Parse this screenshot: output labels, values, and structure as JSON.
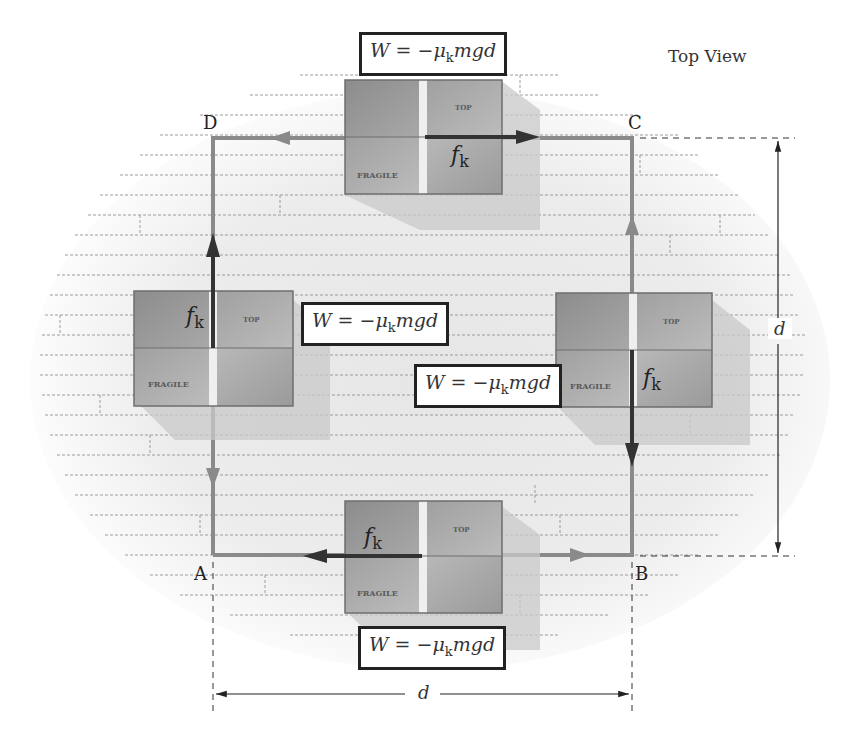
{
  "title": "Top View",
  "corners": {
    "A": "A",
    "B": "B",
    "C": "C",
    "D": "D"
  },
  "work_equation": {
    "W": "W",
    "equals": " = −",
    "mu": "μ",
    "sub": "k",
    "rest": "mgd"
  },
  "friction_label": {
    "f": "f",
    "sub": "k"
  },
  "box_labels": {
    "top": "TOP",
    "fragile": "FRAGILE"
  },
  "dimensions": {
    "horizontal": "d",
    "vertical": "d"
  },
  "boxes": [
    {
      "side": "top",
      "segment": "C→D",
      "friction_direction": "right",
      "work": "W = −μk mgd"
    },
    {
      "side": "left",
      "segment": "D→A",
      "friction_direction": "up",
      "work": "W = −μk mgd"
    },
    {
      "side": "right",
      "segment": "B→C",
      "friction_direction": "down",
      "work": "W = −μk mgd"
    },
    {
      "side": "bottom",
      "segment": "A→B",
      "friction_direction": "left",
      "work": "W = −μk mgd"
    }
  ],
  "colors": {
    "path": "#8a8a8a",
    "friction_arrow": "#333333",
    "box_dark": "#8f8f8f",
    "box_light": "#b5b5b5",
    "floor_line": "#9a9a9a"
  }
}
